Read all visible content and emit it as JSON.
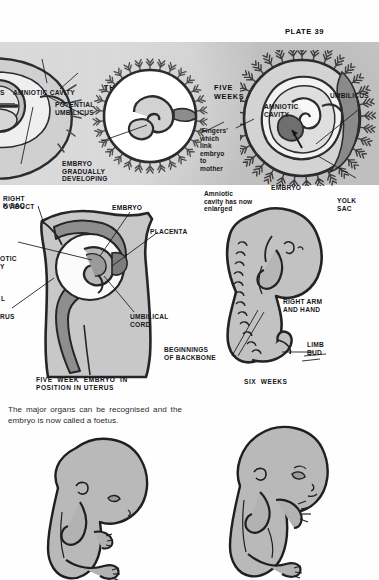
{
  "page": {
    "plate_label": "PLATE 39",
    "background_color": "#fefefe",
    "banner_color": "#c9c9c9",
    "ink_color": "#17181b",
    "tissue_fill": "#c8c8c8",
    "dark_tissue_fill": "#8f8f8f"
  },
  "banner": {
    "headings": [
      {
        "text": "THREE WEEKS",
        "panel": "three-weeks"
      },
      {
        "text": "FIVE\nWEEKS",
        "panel": "five-weeks"
      }
    ],
    "panel_two_weeks": {
      "labels": [
        {
          "name": "potential-umbilicus-partial",
          "text": "S"
        },
        {
          "name": "amniotic-cavity",
          "text": "AMNIOTIC CAVITY"
        },
        {
          "name": "potential-umbilicus",
          "text": "POTENTIAL\nUMBILICUS"
        },
        {
          "name": "embryo-gradually-developing",
          "text": "EMBRYO\nGRADUALLY\nDEVELOPING"
        },
        {
          "name": "yolk-sac",
          "text": "K SAC"
        }
      ]
    },
    "panel_three_weeks": {
      "labels": []
    },
    "panel_five_weeks": {
      "labels": [
        {
          "name": "fingers-which-link",
          "text": "'Fingers'\nwhich\nlink\nembryo\nto\nmother"
        },
        {
          "name": "amniotic-cavity",
          "text": "AMNIOTIC\nCAVITY"
        },
        {
          "name": "umbilicus",
          "text": "UMBILICUS"
        },
        {
          "name": "embryo",
          "text": "EMBRYO"
        },
        {
          "name": "yolk-sac",
          "text": "YOLK\nSAC"
        },
        {
          "name": "amniotic-cavity-enlarged",
          "text": "Amniotic\ncavity has now\nenlarged"
        }
      ]
    }
  },
  "uterus_figure": {
    "caption": "FIVE  WEEK  EMBRYO  IN\nPOSITION IN UTERUS",
    "labels": [
      {
        "name": "right-oviduct",
        "text": "RIGHT\nOVIDUCT"
      },
      {
        "name": "embryo",
        "text": "EMBRYO"
      },
      {
        "name": "placenta",
        "text": "PLACENTA"
      },
      {
        "name": "amniotic-cavity",
        "text": "OTIC\nY"
      },
      {
        "name": "wall",
        "text": "L"
      },
      {
        "name": "uterus",
        "text": "RUS"
      },
      {
        "name": "umbilical-cord",
        "text": "UMBILICAL\nCORD"
      }
    ]
  },
  "six_weeks_figure": {
    "caption": "SIX  WEEKS",
    "labels": [
      {
        "name": "right-arm-and-hand",
        "text": "RIGHT ARM\nAND HAND"
      },
      {
        "name": "limb-bud",
        "text": "LIMB\nBUD"
      },
      {
        "name": "beginnings-of-backbone",
        "text": "BEGINNINGS\nOF BACKBONE"
      }
    ]
  },
  "body_text": {
    "paragraph": "The major organs can be recognised and the embryo is now called a foetus."
  },
  "foetus_figures": [
    {
      "name": "foetus-early",
      "caption": ""
    },
    {
      "name": "foetus-later",
      "caption": ""
    }
  ]
}
